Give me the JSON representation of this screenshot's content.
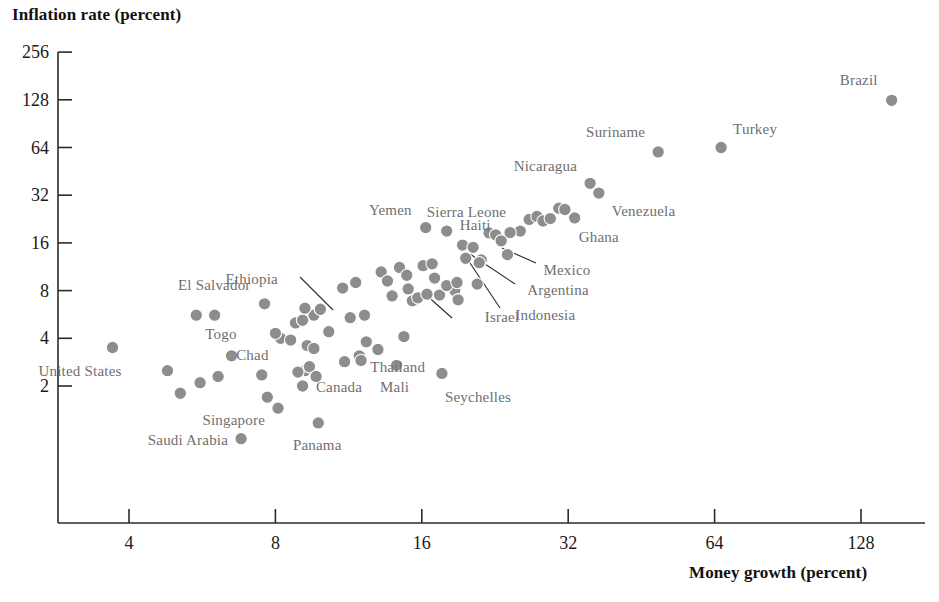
{
  "chart_data": {
    "type": "scatter",
    "title": "",
    "xlabel": "Money growth (percent)",
    "ylabel": "Inflation rate (percent)",
    "xscale": "log2",
    "yscale": "log2",
    "xlim": [
      2.8,
      190
    ],
    "ylim": [
      0.75,
      300
    ],
    "xticks": [
      4,
      8,
      16,
      32,
      64,
      128
    ],
    "yticks": [
      2,
      4,
      8,
      16,
      32,
      64,
      128,
      256
    ],
    "grid": false,
    "legend": false,
    "marker_color": "#8d8d8d",
    "label_color": "#6f6f6f",
    "axis_color": "#2b2b2b",
    "points": [
      {
        "name": "Brazil",
        "x": 148.0,
        "y": 127.0,
        "label": "Brazil",
        "lpos": "left-up"
      },
      {
        "name": "Turkey",
        "x": 66.0,
        "y": 64.0,
        "label": "Turkey",
        "lpos": "right-up"
      },
      {
        "name": "Suriname",
        "x": 49.0,
        "y": 60.0,
        "label": "Suriname",
        "lpos": "left-up"
      },
      {
        "name": "Nicaragua",
        "x": 35.5,
        "y": 38.0,
        "label": "Nicaragua",
        "lpos": "left-up"
      },
      {
        "name": "Venezuela",
        "x": 37.0,
        "y": 33.0,
        "label": "Venezuela",
        "lpos": "right-down"
      },
      {
        "name": "Ghana",
        "x": 33.0,
        "y": 23.0,
        "label": "Ghana",
        "lpos": "right-down"
      },
      {
        "name": "Sierra Leone",
        "x": 25.5,
        "y": 19.0,
        "label": "Sierra Leone",
        "lpos": "left-up"
      },
      {
        "name": "Yemen",
        "x": 16.3,
        "y": 20.0,
        "label": "Yemen",
        "lpos": "left-up"
      },
      {
        "name": "Haiti",
        "x": 18.0,
        "y": 19.0,
        "label": "Haiti",
        "lpos": "right-up"
      },
      {
        "name": "Mexico",
        "x": 24.0,
        "y": 13.5,
        "label": "Mexico",
        "lpos": "leader-right"
      },
      {
        "name": "Argentina",
        "x": 21.2,
        "y": 12.5,
        "label": "Argentina",
        "lpos": "leader-right"
      },
      {
        "name": "Indonesia",
        "x": 21.0,
        "y": 12.0,
        "label": "Indonesia",
        "lpos": "leader-down"
      },
      {
        "name": "Israel",
        "x": 18.7,
        "y": 8.0,
        "label": "Israel",
        "lpos": "leader-down"
      },
      {
        "name": "Ethiopia",
        "x": 9.6,
        "y": 5.6,
        "label": "Ethiopia",
        "lpos": "leader-upleft"
      },
      {
        "name": "El Salvador",
        "x": 7.6,
        "y": 6.6,
        "label": "El Salvador",
        "lpos": "left-up"
      },
      {
        "name": "Chad",
        "x": 8.2,
        "y": 4.0,
        "label": "Chad",
        "lpos": "left-down"
      },
      {
        "name": "Togo",
        "x": 5.5,
        "y": 5.6,
        "label": "Togo",
        "lpos": "right-down"
      },
      {
        "name": "Thailand",
        "x": 11.9,
        "y": 3.1,
        "label": "Thailand",
        "lpos": "right-down"
      },
      {
        "name": "Mali",
        "x": 14.2,
        "y": 2.7,
        "label": "Mali",
        "lpos": "left-down"
      },
      {
        "name": "Seychelles",
        "x": 17.6,
        "y": 2.4,
        "label": "Seychelles",
        "lpos": "right-down"
      },
      {
        "name": "Canada",
        "x": 9.2,
        "y": 2.5,
        "label": "Canada",
        "lpos": "right-down"
      },
      {
        "name": "Singapore",
        "x": 8.1,
        "y": 1.45,
        "label": "Singapore",
        "lpos": "left-down"
      },
      {
        "name": "Panama",
        "x": 9.8,
        "y": 1.17,
        "label": "Panama",
        "lpos": "right-down"
      },
      {
        "name": "Saudi Arabia",
        "x": 6.8,
        "y": 0.93,
        "label": "Saudi Arabia",
        "lpos": "left"
      },
      {
        "name": "United States",
        "x": 3.7,
        "y": 3.5,
        "label": "United States",
        "lpos": "left-down"
      },
      {
        "name": "unlabeled-01",
        "x": 4.8,
        "y": 2.5,
        "label": "",
        "lpos": ""
      },
      {
        "name": "unlabeled-02",
        "x": 5.1,
        "y": 1.8,
        "label": "",
        "lpos": ""
      },
      {
        "name": "unlabeled-03",
        "x": 5.6,
        "y": 2.1,
        "label": "",
        "lpos": ""
      },
      {
        "name": "unlabeled-04",
        "x": 6.0,
        "y": 5.6,
        "label": "",
        "lpos": ""
      },
      {
        "name": "unlabeled-05",
        "x": 6.5,
        "y": 3.1,
        "label": "",
        "lpos": ""
      },
      {
        "name": "unlabeled-06",
        "x": 6.1,
        "y": 2.3,
        "label": "",
        "lpos": ""
      },
      {
        "name": "unlabeled-07",
        "x": 7.5,
        "y": 2.35,
        "label": "",
        "lpos": ""
      },
      {
        "name": "unlabeled-08",
        "x": 7.7,
        "y": 1.7,
        "label": "",
        "lpos": ""
      },
      {
        "name": "unlabeled-09",
        "x": 8.0,
        "y": 4.3,
        "label": "",
        "lpos": ""
      },
      {
        "name": "unlabeled-10",
        "x": 8.6,
        "y": 3.9,
        "label": "",
        "lpos": ""
      },
      {
        "name": "unlabeled-11",
        "x": 8.8,
        "y": 5.0,
        "label": "",
        "lpos": ""
      },
      {
        "name": "unlabeled-12",
        "x": 9.1,
        "y": 5.2,
        "label": "",
        "lpos": ""
      },
      {
        "name": "unlabeled-13",
        "x": 9.2,
        "y": 6.2,
        "label": "",
        "lpos": ""
      },
      {
        "name": "unlabeled-14",
        "x": 9.9,
        "y": 6.1,
        "label": "",
        "lpos": ""
      },
      {
        "name": "unlabeled-15",
        "x": 9.3,
        "y": 3.6,
        "label": "",
        "lpos": ""
      },
      {
        "name": "unlabeled-16",
        "x": 9.6,
        "y": 3.45,
        "label": "",
        "lpos": ""
      },
      {
        "name": "unlabeled-17",
        "x": 8.9,
        "y": 2.45,
        "label": "",
        "lpos": ""
      },
      {
        "name": "unlabeled-18",
        "x": 9.1,
        "y": 2.0,
        "label": "",
        "lpos": ""
      },
      {
        "name": "unlabeled-19",
        "x": 9.4,
        "y": 2.65,
        "label": "",
        "lpos": ""
      },
      {
        "name": "unlabeled-20",
        "x": 9.7,
        "y": 2.3,
        "label": "",
        "lpos": ""
      },
      {
        "name": "unlabeled-21",
        "x": 11.0,
        "y": 8.3,
        "label": "",
        "lpos": ""
      },
      {
        "name": "unlabeled-22",
        "x": 11.7,
        "y": 9.0,
        "label": "",
        "lpos": ""
      },
      {
        "name": "unlabeled-23",
        "x": 12.2,
        "y": 5.6,
        "label": "",
        "lpos": ""
      },
      {
        "name": "unlabeled-24",
        "x": 12.3,
        "y": 3.8,
        "label": "",
        "lpos": ""
      },
      {
        "name": "unlabeled-25",
        "x": 12.0,
        "y": 2.9,
        "label": "",
        "lpos": ""
      },
      {
        "name": "unlabeled-26",
        "x": 13.2,
        "y": 10.5,
        "label": "",
        "lpos": ""
      },
      {
        "name": "unlabeled-27",
        "x": 13.6,
        "y": 9.2,
        "label": "",
        "lpos": ""
      },
      {
        "name": "unlabeled-28",
        "x": 13.9,
        "y": 7.4,
        "label": "",
        "lpos": ""
      },
      {
        "name": "unlabeled-29",
        "x": 14.4,
        "y": 11.2,
        "label": "",
        "lpos": ""
      },
      {
        "name": "unlabeled-30",
        "x": 14.9,
        "y": 10.0,
        "label": "",
        "lpos": ""
      },
      {
        "name": "unlabeled-31",
        "x": 15.0,
        "y": 8.2,
        "label": "",
        "lpos": ""
      },
      {
        "name": "unlabeled-32",
        "x": 15.3,
        "y": 6.9,
        "label": "",
        "lpos": ""
      },
      {
        "name": "unlabeled-33",
        "x": 15.7,
        "y": 7.2,
        "label": "",
        "lpos": ""
      },
      {
        "name": "unlabeled-34",
        "x": 16.1,
        "y": 11.5,
        "label": "",
        "lpos": ""
      },
      {
        "name": "unlabeled-35",
        "x": 16.8,
        "y": 11.8,
        "label": "",
        "lpos": ""
      },
      {
        "name": "unlabeled-36",
        "x": 17.0,
        "y": 9.6,
        "label": "",
        "lpos": ""
      },
      {
        "name": "unlabeled-37",
        "x": 16.4,
        "y": 7.6,
        "label": "",
        "lpos": ""
      },
      {
        "name": "unlabeled-38",
        "x": 17.4,
        "y": 7.5,
        "label": "",
        "lpos": ""
      },
      {
        "name": "unlabeled-39",
        "x": 18.0,
        "y": 8.6,
        "label": "",
        "lpos": ""
      },
      {
        "name": "unlabeled-40",
        "x": 18.9,
        "y": 9.0,
        "label": "",
        "lpos": ""
      },
      {
        "name": "unlabeled-41",
        "x": 19.4,
        "y": 15.5,
        "label": "",
        "lpos": ""
      },
      {
        "name": "unlabeled-42",
        "x": 19.7,
        "y": 12.8,
        "label": "",
        "lpos": ""
      },
      {
        "name": "unlabeled-43",
        "x": 20.4,
        "y": 15.0,
        "label": "",
        "lpos": ""
      },
      {
        "name": "unlabeled-44",
        "x": 20.8,
        "y": 8.8,
        "label": "",
        "lpos": ""
      },
      {
        "name": "unlabeled-45",
        "x": 22.0,
        "y": 18.5,
        "label": "",
        "lpos": ""
      },
      {
        "name": "unlabeled-46",
        "x": 22.7,
        "y": 18.0,
        "label": "",
        "lpos": ""
      },
      {
        "name": "unlabeled-47",
        "x": 23.3,
        "y": 16.5,
        "label": "",
        "lpos": ""
      },
      {
        "name": "unlabeled-48",
        "x": 24.3,
        "y": 18.6,
        "label": "",
        "lpos": ""
      },
      {
        "name": "unlabeled-49",
        "x": 26.6,
        "y": 22.5,
        "label": "",
        "lpos": ""
      },
      {
        "name": "unlabeled-50",
        "x": 27.6,
        "y": 23.5,
        "label": "",
        "lpos": ""
      },
      {
        "name": "unlabeled-51",
        "x": 28.4,
        "y": 22.0,
        "label": "",
        "lpos": ""
      },
      {
        "name": "unlabeled-52",
        "x": 29.4,
        "y": 22.8,
        "label": "",
        "lpos": ""
      },
      {
        "name": "unlabeled-53",
        "x": 30.6,
        "y": 26.5,
        "label": "",
        "lpos": ""
      },
      {
        "name": "unlabeled-54",
        "x": 31.5,
        "y": 26.0,
        "label": "",
        "lpos": ""
      },
      {
        "name": "unlabeled-55",
        "x": 14.7,
        "y": 4.1,
        "label": "",
        "lpos": ""
      },
      {
        "name": "unlabeled-56",
        "x": 13.0,
        "y": 3.4,
        "label": "",
        "lpos": ""
      },
      {
        "name": "unlabeled-57",
        "x": 11.4,
        "y": 5.4,
        "label": "",
        "lpos": ""
      },
      {
        "name": "unlabeled-58",
        "x": 10.3,
        "y": 4.4,
        "label": "",
        "lpos": ""
      },
      {
        "name": "unlabeled-59",
        "x": 19.0,
        "y": 7.0,
        "label": "",
        "lpos": ""
      },
      {
        "name": "unlabeled-60",
        "x": 11.1,
        "y": 2.85,
        "label": "",
        "lpos": ""
      }
    ],
    "leaders": [
      {
        "name": "ethiopia-leader",
        "from": [
          300,
          277
        ],
        "to": [
          333,
          310
        ]
      },
      {
        "name": "mexico-leader",
        "from": [
          536,
          263
        ],
        "to": [
          502,
          248
        ]
      },
      {
        "name": "argentina-leader",
        "from": [
          515,
          284
        ],
        "to": [
          470,
          254
        ]
      },
      {
        "name": "indonesia-leader",
        "from": [
          500,
          308
        ],
        "to": [
          466,
          257
        ]
      },
      {
        "name": "israel-leader",
        "from": [
          452,
          318
        ],
        "to": [
          424,
          293
        ]
      }
    ]
  }
}
